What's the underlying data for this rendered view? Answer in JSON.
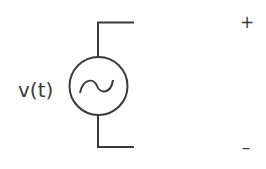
{
  "diagram": {
    "type": "circuit-schematic",
    "component": "ac-voltage-source",
    "source_label": "v(t)",
    "terminals": {
      "positive": "+",
      "negative": "–"
    },
    "colors": {
      "stroke": "#3a3a3a",
      "background": "#ffffff"
    }
  }
}
